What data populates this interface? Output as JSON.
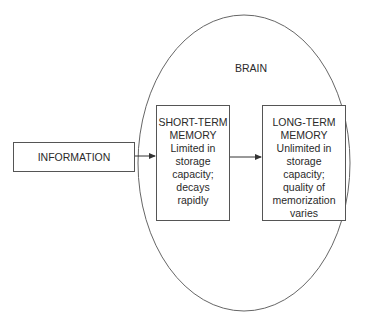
{
  "diagram": {
    "container": {
      "label": "BRAIN",
      "shape": "ellipse"
    },
    "nodes": [
      {
        "id": "information",
        "label": "INFORMATION",
        "lines": [
          "INFORMATION"
        ]
      },
      {
        "id": "short_term_memory",
        "title": "SHORT-TERM MEMORY",
        "lines": [
          "SHORT-TERM",
          "MEMORY",
          "Limited in",
          "storage",
          "capacity;",
          "decays",
          "rapidly"
        ]
      },
      {
        "id": "long_term_memory",
        "title": "LONG-TERM MEMORY",
        "lines": [
          "LONG-TERM",
          "MEMORY",
          "Unlimited in",
          "storage",
          "capacity;",
          "quality of",
          "memorization",
          "varies"
        ]
      }
    ],
    "edges": [
      {
        "from": "information",
        "to": "short_term_memory"
      },
      {
        "from": "short_term_memory",
        "to": "long_term_memory"
      }
    ],
    "colors": {
      "stroke": "#555555",
      "text": "#2a2a2a",
      "background": "#ffffff"
    }
  }
}
